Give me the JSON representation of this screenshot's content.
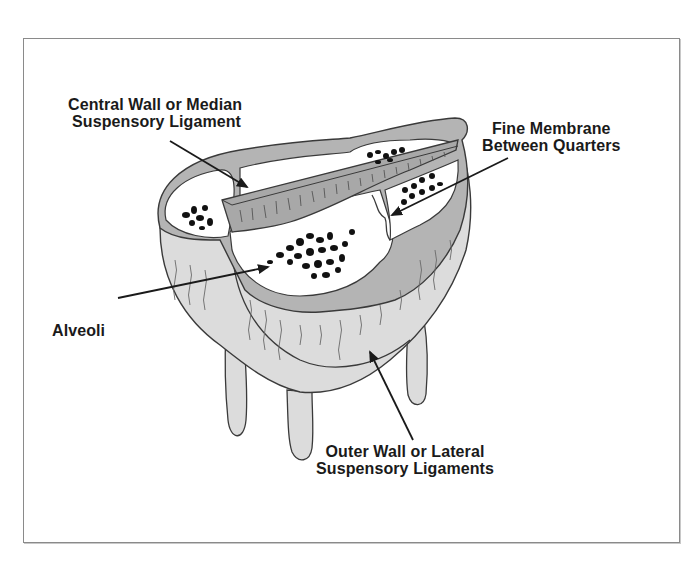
{
  "diagram": {
    "colors": {
      "frame_border": "#8a8a8a",
      "tissue_fill": "#dcdcdc",
      "wall_fill": "#b4b4b4",
      "ligament_fill": "#a8a8a8",
      "cavity_fill": "#ffffff",
      "alveoli_fill": "#111111",
      "outline": "#3a3a3a",
      "text": "#1a1a1a"
    },
    "labels": [
      {
        "id": "central-wall",
        "lines": [
          "Central Wall or Median",
          "Suspensory Ligament"
        ]
      },
      {
        "id": "fine-membrane",
        "lines": [
          "Fine Membrane",
          "Between Quarters"
        ]
      },
      {
        "id": "alveoli",
        "lines": [
          "Alveoli"
        ]
      },
      {
        "id": "outer-wall",
        "lines": [
          "Outer Wall or Lateral",
          "Suspensory Ligaments"
        ]
      }
    ]
  }
}
